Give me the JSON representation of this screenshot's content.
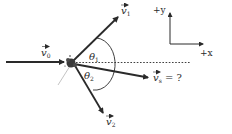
{
  "diagram": {
    "colors": {
      "ink": "#2a2a2a",
      "background": "#ffffff"
    },
    "vectors": [
      {
        "id": "v0",
        "symbol": "v",
        "subscript": "0",
        "suffix": "",
        "role": "incoming"
      },
      {
        "id": "v1",
        "symbol": "v",
        "subscript": "1",
        "suffix": "",
        "role": "outgoing"
      },
      {
        "id": "v2",
        "symbol": "v",
        "subscript": "2",
        "suffix": "",
        "role": "outgoing"
      },
      {
        "id": "vs",
        "symbol": "v",
        "subscript": "s",
        "suffix": " = ?",
        "role": "unknown"
      }
    ],
    "angles": [
      {
        "id": "theta1",
        "symbol": "θ",
        "subscript": "1"
      },
      {
        "id": "theta2",
        "symbol": "θ",
        "subscript": "2"
      }
    ],
    "axes": {
      "y_label": "+y",
      "x_label": "+x"
    }
  }
}
